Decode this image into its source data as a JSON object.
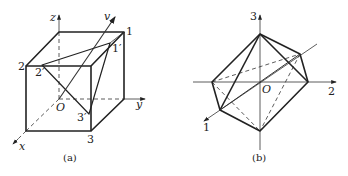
{
  "figure_a": {
    "caption": "(a)",
    "labels": {
      "z": "z",
      "y": "y",
      "x": "x",
      "v": "v",
      "origin": "O",
      "v1": "1",
      "v2": "2",
      "v3": "3",
      "v1p": "1′",
      "v2p": "2′",
      "v3p": "3′"
    }
  },
  "figure_b": {
    "caption": "(b)",
    "labels": {
      "axis1": "1",
      "axis2": "2",
      "axis3": "3",
      "origin": "O"
    }
  },
  "colors": {
    "stroke": "#222222",
    "background": "#ffffff"
  }
}
